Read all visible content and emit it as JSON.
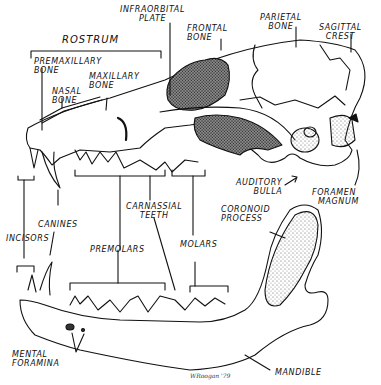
{
  "diagram": {
    "labels": {
      "rostrum": "ROSTRUM",
      "infraorbital_plate": [
        "INFRAORBITAL",
        "PLATE"
      ],
      "frontal_bone": [
        "FRONTAL",
        "BONE"
      ],
      "parietal_bone": [
        "PARIETAL",
        "BONE"
      ],
      "sagittal_crest": [
        "SAGITTAL",
        "CREST"
      ],
      "premaxillary_bone": [
        "PREMAXILLARY",
        "BONE"
      ],
      "maxillary_bone": [
        "MAXILLARY",
        "BONE"
      ],
      "nasal_bone": [
        "NASAL",
        "BONE"
      ],
      "auditory_bulla": [
        "AUDITORY",
        "BULLA"
      ],
      "foramen_magnum": [
        "FORAMEN",
        "MAGNUM"
      ],
      "coronoid_process": [
        "CORONOID",
        "PROCESS"
      ],
      "carnassial_teeth": [
        "CARNASSIAL",
        "TEETH"
      ],
      "canines": "CANINES",
      "incisors": "INCISORS",
      "premolars": "PREMOLARS",
      "molars": "MOLARS",
      "mental_foramina": [
        "MENTAL",
        "FORAMINA"
      ],
      "mandible": "MANDIBLE"
    },
    "signature": "WRoogan '79",
    "colors": {
      "ink": "#111111",
      "background": "#ffffff",
      "stipple": "#555555"
    }
  }
}
